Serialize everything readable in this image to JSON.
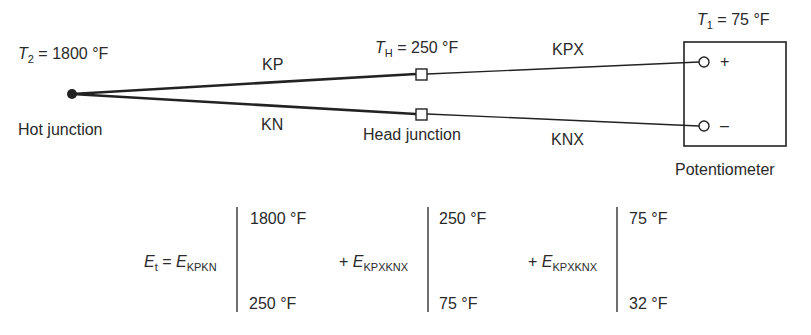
{
  "diagram": {
    "hot_junction": {
      "temp_symbol": "T",
      "temp_subscript": "2",
      "temp_value": "= 1800 °F",
      "label": "Hot junction"
    },
    "head_junction": {
      "temp_symbol": "T",
      "temp_subscript": "H",
      "temp_value": "= 250 °F",
      "label": "Head junction"
    },
    "potentiometer": {
      "temp_symbol": "T",
      "temp_subscript": "1",
      "temp_value": "= 75 °F",
      "label": "Potentiometer",
      "plus_terminal": "+",
      "minus_terminal": "–"
    },
    "wires": {
      "thermocouple_positive": "KP",
      "thermocouple_negative": "KN",
      "extension_positive": "KPX",
      "extension_negative": "KNX"
    }
  },
  "equation": {
    "lhs_symbol": "E",
    "lhs_subscript": "t",
    "equals": "=",
    "terms": [
      {
        "prefix": "",
        "symbol": "E",
        "subscript": "KPKN",
        "upper": "1800 °F",
        "lower": "250 °F"
      },
      {
        "prefix": "+",
        "symbol": "E",
        "subscript": "KPXKNX",
        "upper": "250 °F",
        "lower": "75 °F"
      },
      {
        "prefix": "+",
        "symbol": "E",
        "subscript": "KPXKNX",
        "upper": "75 °F",
        "lower": "32 °F"
      }
    ]
  },
  "colors": {
    "line": "#222222",
    "text": "#2a2a2a",
    "background": "#ffffff"
  }
}
